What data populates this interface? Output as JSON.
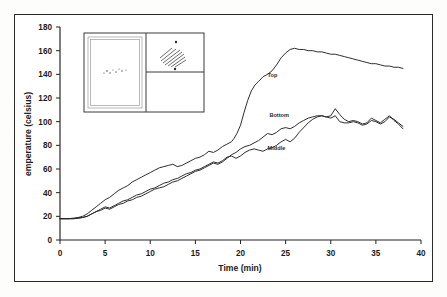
{
  "figure": {
    "name": "temperature-vs-time-line-chart"
  },
  "axes": {
    "x_title": "Time (min)",
    "y_title": "emperature (celsius)",
    "x_ticks": [
      "0",
      "5",
      "10",
      "15",
      "20",
      "25",
      "30",
      "35",
      "40"
    ],
    "y_ticks": [
      "0",
      "20",
      "40",
      "60",
      "80",
      "100",
      "120",
      "140",
      "160",
      "180"
    ]
  },
  "series_labels": {
    "top": "Top",
    "bottom": "Bottom",
    "middle": "Middle"
  },
  "colors": {
    "line": "#232323",
    "frame": "#2b2b2b",
    "background": "#ffffff"
  },
  "inset": {
    "name": "apparatus-schematic",
    "panels": [
      "left-chamber",
      "upper-right-hatched-chamber",
      "lower-right-chamber"
    ]
  },
  "chart_data": {
    "type": "line",
    "title": "",
    "subtitle": "",
    "xlabel": "Time (min)",
    "ylabel": "emperature (celsius)",
    "xlim": [
      0,
      40
    ],
    "ylim": [
      0,
      180
    ],
    "xticks": [
      0,
      5,
      10,
      15,
      20,
      25,
      30,
      35,
      40
    ],
    "yticks": [
      0,
      20,
      40,
      60,
      80,
      100,
      120,
      140,
      160,
      180
    ],
    "grid": false,
    "legend": "inline-annotations",
    "annotations": [
      {
        "text": "Top",
        "x": 23.0,
        "y": 138.0
      },
      {
        "text": "Bottom",
        "x": 23.2,
        "y": 104.0
      },
      {
        "text": "Middle",
        "x": 23.0,
        "y": 76.0
      }
    ],
    "series": [
      {
        "name": "Top",
        "x": [
          0,
          0.5,
          1,
          1.5,
          2,
          2.5,
          3,
          3.5,
          4,
          4.5,
          5,
          5.5,
          6,
          6.5,
          7,
          7.5,
          8,
          8.5,
          9,
          9.5,
          10,
          10.5,
          11,
          11.5,
          12,
          12.5,
          13,
          13.5,
          14,
          14.5,
          15,
          15.5,
          16,
          16.5,
          17,
          17.5,
          18,
          18.5,
          19,
          19.3,
          19.6,
          20,
          20.4,
          20.8,
          21.2,
          21.6,
          22,
          22.5,
          23,
          23.5,
          24,
          24.5,
          25,
          25.5,
          26,
          26.5,
          27,
          27.5,
          28,
          28.5,
          29,
          29.5,
          30,
          30.5,
          31,
          31.5,
          32,
          32.5,
          33,
          33.5,
          34,
          34.5,
          35,
          35.5,
          36,
          36.5,
          37,
          37.5,
          38
        ],
        "y": [
          18,
          18,
          18,
          18.5,
          19,
          20,
          22,
          25,
          28,
          31,
          34,
          36,
          39,
          42,
          44,
          46,
          49,
          51,
          53,
          55,
          57,
          59,
          61,
          62,
          63,
          64,
          62,
          63,
          65,
          67,
          69,
          70,
          72,
          75,
          74,
          76,
          79,
          81,
          83,
          86,
          90,
          97,
          108,
          118,
          126,
          131,
          134,
          138,
          140,
          143,
          148,
          154,
          158,
          161,
          162,
          161,
          161,
          160,
          160,
          159,
          159,
          158,
          157,
          157,
          156,
          155,
          154,
          153,
          152,
          151,
          150,
          149,
          149,
          148,
          147,
          147,
          146,
          146,
          145
        ]
      },
      {
        "name": "Bottom",
        "x": [
          0,
          0.5,
          1,
          1.5,
          2,
          2.5,
          3,
          3.5,
          4,
          4.5,
          5,
          5.5,
          6,
          6.5,
          7,
          7.5,
          8,
          8.5,
          9,
          9.5,
          10,
          10.5,
          11,
          11.5,
          12,
          12.5,
          13,
          13.5,
          14,
          14.5,
          15,
          15.5,
          16,
          16.5,
          17,
          17.5,
          18,
          18.5,
          19,
          19.5,
          20,
          20.5,
          21,
          21.5,
          22,
          22.5,
          23,
          23.5,
          24,
          24.5,
          25,
          25.5,
          26,
          26.5,
          27,
          27.5,
          28,
          28.5,
          29,
          29.5,
          30,
          30.5,
          31,
          31.5,
          32,
          32.5,
          33,
          33.5,
          34,
          34.5,
          35,
          35.5,
          36,
          36.5,
          37,
          37.5,
          38
        ],
        "y": [
          18,
          18,
          18,
          18,
          18.5,
          19,
          20,
          22,
          24,
          25,
          27,
          26,
          28,
          30,
          31,
          33,
          34,
          36,
          37,
          39,
          41,
          43,
          44,
          45,
          47,
          49,
          50,
          52,
          54,
          56,
          58,
          59,
          61,
          63,
          65,
          64,
          66,
          69,
          72,
          74,
          77,
          79,
          80,
          82,
          84,
          87,
          90,
          89,
          91,
          94,
          95,
          94,
          96,
          99,
          101,
          103,
          104,
          105,
          105,
          104,
          105,
          111,
          106,
          102,
          100,
          101,
          100,
          98,
          99,
          103,
          101,
          99,
          102,
          105,
          101,
          98,
          94
        ]
      },
      {
        "name": "Middle",
        "x": [
          0,
          0.5,
          1,
          1.5,
          2,
          2.5,
          3,
          3.5,
          4,
          4.5,
          5,
          5.5,
          6,
          6.5,
          7,
          7.5,
          8,
          8.5,
          9,
          9.5,
          10,
          10.5,
          11,
          11.5,
          12,
          12.5,
          13,
          13.5,
          14,
          14.5,
          15,
          15.5,
          16,
          16.5,
          17,
          17.5,
          18,
          18.5,
          19,
          19.5,
          20,
          20.5,
          21,
          21.5,
          22,
          22.5,
          23,
          23.5,
          24,
          24.5,
          25,
          25.5,
          26,
          26.5,
          27,
          27.5,
          28,
          28.5,
          29,
          29.5,
          30,
          30.5,
          31,
          31.5,
          32,
          32.5,
          33,
          33.5,
          34,
          34.5,
          35,
          35.5,
          36,
          36.5,
          37,
          37.5,
          38
        ],
        "y": [
          18,
          18,
          18,
          18,
          18.5,
          19,
          20,
          22,
          24,
          26,
          28,
          27,
          29,
          31,
          33,
          34,
          36,
          38,
          39,
          41,
          43,
          44,
          46,
          48,
          49,
          51,
          52,
          54,
          56,
          57,
          59,
          60,
          62,
          64,
          66,
          65,
          67,
          70,
          71,
          69,
          71,
          74,
          76,
          77,
          76,
          75,
          77,
          78,
          80,
          83,
          85,
          83,
          86,
          91,
          95,
          99,
          102,
          104,
          105,
          104,
          103,
          105,
          100,
          99,
          99,
          100,
          99,
          97,
          98,
          101,
          100,
          98,
          100,
          104,
          102,
          99,
          96
        ]
      }
    ]
  }
}
